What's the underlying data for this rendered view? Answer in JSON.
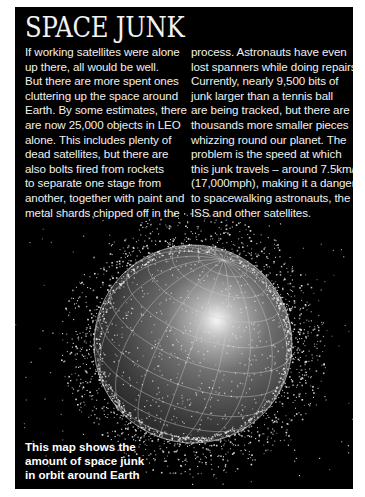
{
  "article": {
    "title": "SPACE JUNK",
    "left_column": [
      "If working satellites were alone",
      "up there, all would be well.",
      "But there are more spent ones",
      "cluttering up the space around",
      "Earth. By some estimates, there",
      "are now 25,000 objects in LEO",
      "alone. This includes plenty of",
      "dead satellites, but there are",
      "also bolts fired from rockets",
      "to separate one stage from",
      "another, together with paint and",
      "metal shards chipped off in the"
    ],
    "right_column": [
      "process. Astronauts have even",
      "lost spanners while doing repairs.",
      "Currently, nearly 9,500 bits of",
      "junk larger than a tennis ball",
      "are being tracked, but there are",
      "thousands more smaller pieces",
      "whizzing round our planet. The",
      "problem is the speed at which",
      "this junk travels – around 7.5km/s",
      "(17,000mph), making it a danger",
      "to spacewalking astronauts, the",
      "ISS and other satellites."
    ]
  },
  "figure": {
    "caption": [
      "This map shows the",
      "amount of space junk",
      "in orbit around Earth"
    ],
    "image_subject": "earth-globe-with-space-debris",
    "colors": {
      "background": "#000000",
      "text": "#f0f0f0",
      "globe_dark": "#2a2a2a",
      "globe_highlight": "#f4f4f4",
      "debris": "#e8e8e8"
    }
  }
}
